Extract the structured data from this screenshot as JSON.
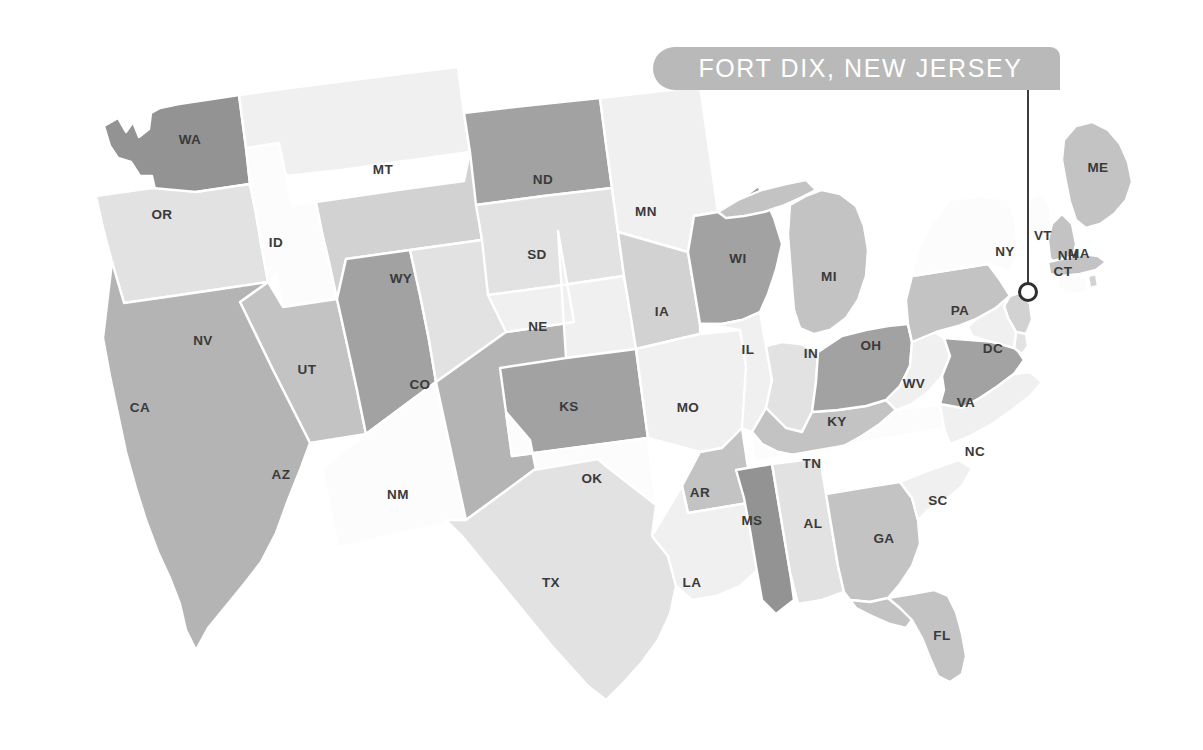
{
  "callout": {
    "label": "FORT DIX, NEW JERSEY",
    "marker_icon": "location-dot-icon",
    "leader_line_icon": "leader-line-icon",
    "banner_color": "#b9b9b9",
    "banner_text_color": "#ffffff",
    "line_color": "#3d3d3d"
  },
  "map": {
    "title": "United States Choropleth Map",
    "background": "#ffffff",
    "border_color": "#ffffff",
    "label_color": "#3a3a3a",
    "shades": {
      "s0": "#fcfcfc",
      "s1": "#f0f0f0",
      "s2": "#e2e2e2",
      "s3": "#d2d2d2",
      "s4": "#c3c3c3",
      "s5": "#b4b4b4",
      "s6": "#a2a2a2",
      "s7": "#939393"
    },
    "states": [
      {
        "id": "WA",
        "label": "WA",
        "shade": "s7",
        "lx": 190,
        "ly": 140
      },
      {
        "id": "OR",
        "label": "OR",
        "shade": "s2",
        "lx": 162,
        "ly": 215
      },
      {
        "id": "ID",
        "label": "ID",
        "shade": "s0",
        "lx": 276,
        "ly": 243
      },
      {
        "id": "MT",
        "label": "MT",
        "shade": "s1",
        "lx": 383,
        "ly": 170
      },
      {
        "id": "WY",
        "label": "WY",
        "shade": "s3",
        "lx": 401,
        "ly": 279
      },
      {
        "id": "NV",
        "label": "NV",
        "shade": "s4",
        "lx": 203,
        "ly": 341
      },
      {
        "id": "UT",
        "label": "UT",
        "shade": "s6",
        "lx": 307,
        "ly": 370
      },
      {
        "id": "CA",
        "label": "CA",
        "shade": "s5",
        "lx": 140,
        "ly": 408
      },
      {
        "id": "AZ",
        "label": "AZ",
        "shade": "s0",
        "lx": 281,
        "ly": 475
      },
      {
        "id": "CO",
        "label": "CO",
        "shade": "s2",
        "lx": 420,
        "ly": 385
      },
      {
        "id": "NM",
        "label": "NM",
        "shade": "s5",
        "lx": 398,
        "ly": 495
      },
      {
        "id": "ND",
        "label": "ND",
        "shade": "s6",
        "lx": 543,
        "ly": 180
      },
      {
        "id": "SD",
        "label": "SD",
        "shade": "s2",
        "lx": 537,
        "ly": 255
      },
      {
        "id": "NE",
        "label": "NE",
        "shade": "s1",
        "lx": 538,
        "ly": 327
      },
      {
        "id": "KS",
        "label": "KS",
        "shade": "s6",
        "lx": 569,
        "ly": 407
      },
      {
        "id": "OK",
        "label": "OK",
        "shade": "s0",
        "lx": 592,
        "ly": 479
      },
      {
        "id": "TX",
        "label": "TX",
        "shade": "s2",
        "lx": 551,
        "ly": 583
      },
      {
        "id": "MN",
        "label": "MN",
        "shade": "s1",
        "lx": 646,
        "ly": 212
      },
      {
        "id": "IA",
        "label": "IA",
        "shade": "s3",
        "lx": 662,
        "ly": 312
      },
      {
        "id": "MO",
        "label": "MO",
        "shade": "s1",
        "lx": 688,
        "ly": 408
      },
      {
        "id": "AR",
        "label": "AR",
        "shade": "s4",
        "lx": 700,
        "ly": 493
      },
      {
        "id": "LA",
        "label": "LA",
        "shade": "s1",
        "lx": 692,
        "ly": 583
      },
      {
        "id": "WI",
        "label": "WI",
        "shade": "s6",
        "lx": 738,
        "ly": 259
      },
      {
        "id": "IL",
        "label": "IL",
        "shade": "s1",
        "lx": 748,
        "ly": 350
      },
      {
        "id": "MS",
        "label": "MS",
        "shade": "s7",
        "lx": 752,
        "ly": 521
      },
      {
        "id": "MI",
        "label": "MI",
        "shade": "s4",
        "lx": 829,
        "ly": 277
      },
      {
        "id": "IN",
        "label": "IN",
        "shade": "s2",
        "lx": 811,
        "ly": 354
      },
      {
        "id": "KY",
        "label": "KY",
        "shade": "s4",
        "lx": 837,
        "ly": 422
      },
      {
        "id": "TN",
        "label": "TN",
        "shade": "s0",
        "lx": 812,
        "ly": 464
      },
      {
        "id": "AL",
        "label": "AL",
        "shade": "s2",
        "lx": 813,
        "ly": 524
      },
      {
        "id": "OH",
        "label": "OH",
        "shade": "s6",
        "lx": 871,
        "ly": 346
      },
      {
        "id": "WV",
        "label": "WV",
        "shade": "s1",
        "lx": 914,
        "ly": 384
      },
      {
        "id": "GA",
        "label": "GA",
        "shade": "s4",
        "lx": 884,
        "ly": 539
      },
      {
        "id": "FL",
        "label": "FL",
        "shade": "s4",
        "lx": 942,
        "ly": 636
      },
      {
        "id": "PA",
        "label": "PA",
        "shade": "s4",
        "lx": 960,
        "ly": 311
      },
      {
        "id": "NY",
        "label": "NY",
        "shade": "s0",
        "lx": 1005,
        "ly": 252
      },
      {
        "id": "VA",
        "label": "VA",
        "shade": "s6",
        "lx": 966,
        "ly": 403
      },
      {
        "id": "NC",
        "label": "NC",
        "shade": "s1",
        "lx": 975,
        "ly": 452
      },
      {
        "id": "SC",
        "label": "SC",
        "shade": "s1",
        "lx": 938,
        "ly": 501
      },
      {
        "id": "DC",
        "label": "DC",
        "shade": "s1",
        "lx": 993,
        "ly": 349
      },
      {
        "id": "VT",
        "label": "VT",
        "shade": "s0",
        "lx": 1043,
        "ly": 236
      },
      {
        "id": "NH",
        "label": "NH",
        "shade": "s4",
        "lx": 1068,
        "ly": 256
      },
      {
        "id": "MA",
        "label": "MA",
        "shade": "s4",
        "lx": 1079,
        "ly": 254
      },
      {
        "id": "CT",
        "label": "CT",
        "shade": "s0",
        "lx": 1063,
        "ly": 272
      },
      {
        "id": "ME",
        "label": "ME",
        "shade": "s4",
        "lx": 1098,
        "ly": 168
      },
      {
        "id": "NJ",
        "label": "",
        "shade": "s3",
        "lx": 0,
        "ly": 0
      },
      {
        "id": "DE",
        "label": "",
        "shade": "s2",
        "lx": 0,
        "ly": 0
      },
      {
        "id": "MD",
        "label": "",
        "shade": "s1",
        "lx": 0,
        "ly": 0
      },
      {
        "id": "RI",
        "label": "",
        "shade": "s3",
        "lx": 0,
        "ly": 0
      }
    ]
  }
}
